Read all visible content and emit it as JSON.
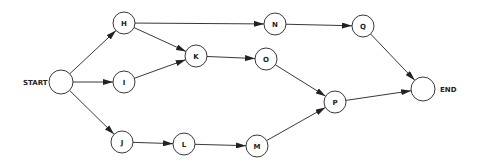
{
  "diagram": {
    "type": "network-flow",
    "colors": {
      "stroke": "#222222",
      "fill": "#ffffff",
      "text": "#222222"
    },
    "labels": {
      "start": "START",
      "end": "END"
    },
    "nodes": [
      {
        "id": "START",
        "label": "",
        "x": 61,
        "y": 82,
        "r": 12
      },
      {
        "id": "H",
        "label": "H",
        "x": 124,
        "y": 23,
        "r": 11
      },
      {
        "id": "I",
        "label": "I",
        "x": 124,
        "y": 82,
        "r": 11
      },
      {
        "id": "J",
        "label": "J",
        "x": 122,
        "y": 142,
        "r": 11
      },
      {
        "id": "K",
        "label": "K",
        "x": 196,
        "y": 56,
        "r": 11
      },
      {
        "id": "L",
        "label": "L",
        "x": 184,
        "y": 144,
        "r": 11
      },
      {
        "id": "M",
        "label": "M",
        "x": 257,
        "y": 146,
        "r": 11
      },
      {
        "id": "N",
        "label": "N",
        "x": 275,
        "y": 24,
        "r": 11
      },
      {
        "id": "O",
        "label": "O",
        "x": 266,
        "y": 59,
        "r": 11
      },
      {
        "id": "P",
        "label": "P",
        "x": 335,
        "y": 102,
        "r": 11
      },
      {
        "id": "Q",
        "label": "Q",
        "x": 363,
        "y": 26,
        "r": 11
      },
      {
        "id": "END",
        "label": "",
        "x": 423,
        "y": 89,
        "r": 12
      }
    ],
    "edges": [
      {
        "from": "START",
        "to": "H"
      },
      {
        "from": "START",
        "to": "I"
      },
      {
        "from": "START",
        "to": "J"
      },
      {
        "from": "H",
        "to": "K"
      },
      {
        "from": "H",
        "to": "N"
      },
      {
        "from": "I",
        "to": "K"
      },
      {
        "from": "J",
        "to": "L"
      },
      {
        "from": "K",
        "to": "O"
      },
      {
        "from": "L",
        "to": "M"
      },
      {
        "from": "N",
        "to": "Q"
      },
      {
        "from": "O",
        "to": "P"
      },
      {
        "from": "M",
        "to": "P"
      },
      {
        "from": "Q",
        "to": "END"
      },
      {
        "from": "P",
        "to": "END"
      }
    ]
  }
}
